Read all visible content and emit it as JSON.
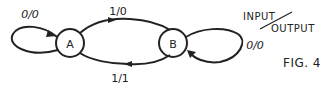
{
  "diagram": {
    "type": "state-machine",
    "figure_label": "FIG. 4",
    "legend": {
      "input": "INPUT",
      "output": "OUTPUT",
      "separator": "/"
    },
    "states": [
      {
        "id": "A",
        "label": "A"
      },
      {
        "id": "B",
        "label": "B"
      }
    ],
    "transitions": [
      {
        "from": "A",
        "to": "A",
        "label": "0/0"
      },
      {
        "from": "A",
        "to": "B",
        "label": "1/0"
      },
      {
        "from": "B",
        "to": "B",
        "label": "0/0"
      },
      {
        "from": "B",
        "to": "A",
        "label": "1/1"
      }
    ]
  }
}
